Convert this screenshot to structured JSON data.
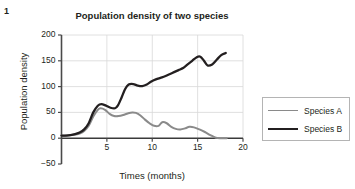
{
  "figure": {
    "number": "1"
  },
  "chart_data": {
    "type": "line",
    "title": "Population density of two species",
    "xlabel": "Times (months)",
    "ylabel": "Population density",
    "xlim": [
      0,
      20
    ],
    "ylim": [
      -50,
      200
    ],
    "xticks": [
      5,
      10,
      15,
      20
    ],
    "yticks": [
      -50,
      0,
      50,
      100,
      150,
      200
    ],
    "xtick_labels": [
      "5",
      "10",
      "15",
      "20"
    ],
    "ytick_labels": [
      "−50",
      "0",
      "50",
      "100",
      "150",
      "200"
    ],
    "grid": true,
    "legend_position": "right",
    "series": [
      {
        "name": "Species A",
        "color": "#8a8a8a",
        "line_width": 2.0,
        "x": [
          0,
          0.5,
          1,
          1.5,
          2,
          2.5,
          3,
          3.5,
          4,
          4.3,
          4.8,
          5.3,
          5.8,
          6.3,
          6.8,
          7.3,
          7.8,
          8.2,
          8.7,
          9.2,
          9.7,
          10.2,
          10.7,
          11.1,
          11.6,
          12.1,
          12.6,
          13.1,
          13.6,
          14.1,
          14.6,
          15.2,
          15.8,
          16.4,
          17.0,
          17.6,
          18.2
        ],
        "y": [
          5,
          5,
          6,
          7,
          9,
          14,
          24,
          42,
          55,
          58,
          55,
          47,
          43,
          43,
          45,
          48,
          50,
          49,
          44,
          36,
          29,
          24,
          24,
          31,
          29,
          22,
          18,
          17,
          19,
          22,
          21,
          17,
          12,
          6,
          1,
          0,
          0
        ]
      },
      {
        "name": "Species B",
        "color": "#231f20",
        "line_width": 2.3,
        "x": [
          0,
          0.5,
          1,
          1.5,
          2,
          2.5,
          3,
          3.5,
          4,
          4.4,
          4.9,
          5.4,
          5.9,
          6.2,
          6.6,
          7.0,
          7.4,
          7.9,
          8.4,
          8.9,
          9.4,
          9.9,
          10.4,
          10.9,
          11.4,
          11.9,
          12.4,
          12.9,
          13.4,
          13.9,
          14.4,
          14.9,
          15.3,
          15.7,
          16.1,
          16.6,
          17.1,
          17.6,
          18.1
        ],
        "y": [
          5,
          5,
          6,
          8,
          11,
          17,
          29,
          50,
          63,
          66,
          63,
          59,
          58,
          63,
          78,
          95,
          104,
          105,
          102,
          101,
          104,
          110,
          114,
          117,
          120,
          124,
          128,
          132,
          136,
          143,
          150,
          157,
          158,
          150,
          141,
          143,
          152,
          161,
          165
        ]
      }
    ]
  }
}
